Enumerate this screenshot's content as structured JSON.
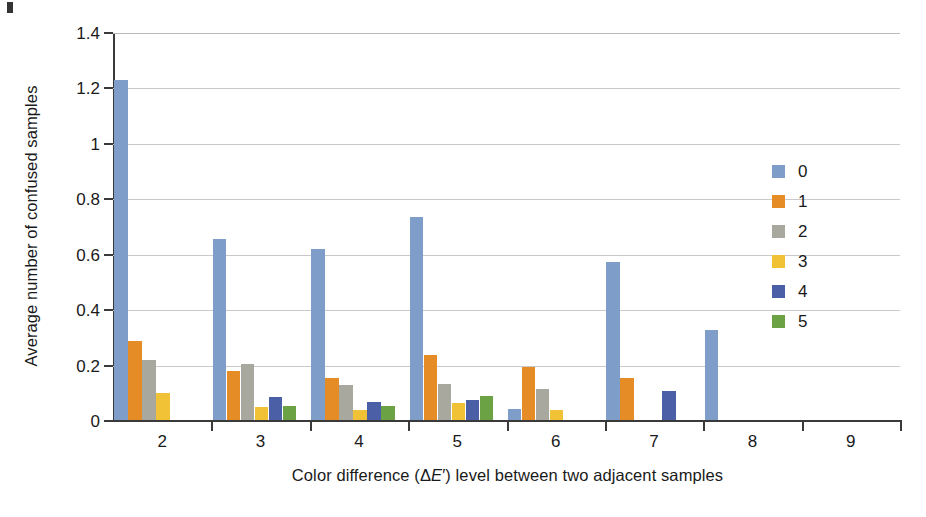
{
  "chart_data": {
    "type": "bar",
    "title": "",
    "xlabel": "Color difference (ΔE′) level between two adjacent samples",
    "ylabel": "Average number of confused samples",
    "categories": [
      "2",
      "3",
      "4",
      "5",
      "6",
      "7",
      "8",
      "9"
    ],
    "ylim": [
      0,
      1.4
    ],
    "ytick_labels": [
      "0",
      "0.2",
      "0.4",
      "0.6",
      "0.8",
      "1",
      "1.2",
      "1.4"
    ],
    "ytick_values": [
      0,
      0.2,
      0.4,
      0.6,
      0.8,
      1,
      1.2,
      1.4
    ],
    "grid": "horizontal",
    "legend_position": "right",
    "series": [
      {
        "name": "0",
        "color": "#7e9dc9",
        "values": [
          1.23,
          0.655,
          0.62,
          0.735,
          0.045,
          0.575,
          0.33,
          0
        ]
      },
      {
        "name": "1",
        "color": "#e58c27",
        "values": [
          0.29,
          0.18,
          0.155,
          0.24,
          0.195,
          0.155,
          0,
          0
        ]
      },
      {
        "name": "2",
        "color": "#a8a89e",
        "values": [
          0.22,
          0.205,
          0.13,
          0.135,
          0.115,
          0,
          0,
          0
        ]
      },
      {
        "name": "3",
        "color": "#f2c236",
        "values": [
          0.1,
          0.05,
          0.04,
          0.065,
          0.04,
          0,
          0,
          0
        ]
      },
      {
        "name": "4",
        "color": "#4a5fa5",
        "values": [
          0,
          0.085,
          0.07,
          0.075,
          0,
          0.11,
          0,
          0
        ]
      },
      {
        "name": "5",
        "color": "#6aa244",
        "values": [
          0,
          0.055,
          0.055,
          0.09,
          0,
          0,
          0,
          0
        ]
      }
    ]
  },
  "legend": {
    "items": [
      {
        "label": "0",
        "color": "#7e9dc9"
      },
      {
        "label": "1",
        "color": "#e58c27"
      },
      {
        "label": "2",
        "color": "#a8a89e"
      },
      {
        "label": "3",
        "color": "#f2c236"
      },
      {
        "label": "4",
        "color": "#4a5fa5"
      },
      {
        "label": "5",
        "color": "#6aa244"
      }
    ]
  },
  "axis_title_x_parts": {
    "before": "Color difference (Δ",
    "italic": "E",
    "after": "′) level between two adjacent samples"
  }
}
